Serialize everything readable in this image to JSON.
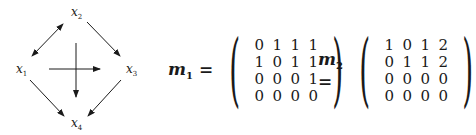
{
  "graph": {
    "nodes": [
      {
        "id": "x1",
        "base": "x",
        "sub": "1",
        "position": "left"
      },
      {
        "id": "x2",
        "base": "x",
        "sub": "2",
        "position": "top"
      },
      {
        "id": "x3",
        "base": "x",
        "sub": "3",
        "position": "right"
      },
      {
        "id": "x4",
        "base": "x",
        "sub": "4",
        "position": "bottom"
      }
    ],
    "edges": [
      {
        "from": "x1",
        "to": "x2",
        "bidirectional": true
      },
      {
        "from": "x2",
        "to": "x3",
        "bidirectional": false
      },
      {
        "from": "x1",
        "to": "x4",
        "bidirectional": false
      },
      {
        "from": "x3",
        "to": "x4",
        "bidirectional": false
      }
    ],
    "center_cross": {
      "horizontal_arrow": "right",
      "vertical_arrow": "down"
    }
  },
  "matrices": [
    {
      "name": "m",
      "sub": "1",
      "equals": "=",
      "rows": [
        [
          "0",
          "1",
          "1",
          "1"
        ],
        [
          "1",
          "0",
          "1",
          "1"
        ],
        [
          "0",
          "0",
          "0",
          "1"
        ],
        [
          "0",
          "0",
          "0",
          "0"
        ]
      ]
    },
    {
      "name": "m",
      "sub": "2",
      "equals": "=",
      "rows": [
        [
          "1",
          "0",
          "1",
          "2"
        ],
        [
          "0",
          "1",
          "1",
          "2"
        ],
        [
          "0",
          "0",
          "0",
          "0"
        ],
        [
          "0",
          "0",
          "0",
          "0"
        ]
      ]
    }
  ]
}
